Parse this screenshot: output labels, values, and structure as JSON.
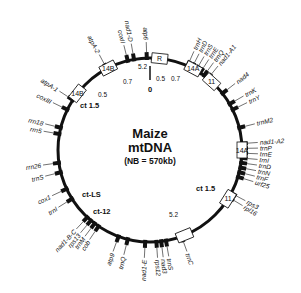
{
  "title": {
    "line1": "Maize",
    "line2": "mtDNA",
    "line3": "(NB = 570kb)"
  },
  "origin_label": "0",
  "colors": {
    "ink": "#111111",
    "background": "#ffffff"
  },
  "genes": [
    {
      "label": "atpA-2",
      "angle": -118,
      "side": "out"
    },
    {
      "label": "coxII",
      "angle": -104,
      "side": "out"
    },
    {
      "label": "nad1-D",
      "angle": -100,
      "side": "out"
    },
    {
      "label": "atp6",
      "angle": -92,
      "side": "out"
    },
    {
      "label": "trnH",
      "angle": -66,
      "side": "out"
    },
    {
      "label": "trnD",
      "angle": -63,
      "side": "out"
    },
    {
      "label": "trnS",
      "angle": -60,
      "side": "out"
    },
    {
      "label": "trnE",
      "angle": -57,
      "side": "out"
    },
    {
      "label": "trnQ",
      "angle": -54,
      "side": "out"
    },
    {
      "label": "nad1-A1",
      "angle": -51,
      "side": "out"
    },
    {
      "label": "nad4",
      "angle": -38,
      "side": "out"
    },
    {
      "label": "trnK",
      "angle": -30,
      "side": "out"
    },
    {
      "label": "trnY",
      "angle": -26,
      "side": "out"
    },
    {
      "label": "trnM2",
      "angle": -14,
      "side": "out"
    },
    {
      "label": "nad1-A2",
      "angle": -4,
      "side": "out"
    },
    {
      "label": "trnP",
      "angle": -1,
      "side": "out"
    },
    {
      "label": "trnE",
      "angle": 2,
      "side": "out"
    },
    {
      "label": "trnI",
      "angle": 5,
      "side": "out"
    },
    {
      "label": "trnD",
      "angle": 8,
      "side": "out"
    },
    {
      "label": "trnN",
      "angle": 11,
      "side": "out"
    },
    {
      "label": "trnF",
      "angle": 14,
      "side": "out"
    },
    {
      "label": "urf25",
      "angle": 17,
      "side": "out"
    },
    {
      "label": "rps3",
      "angle": 28,
      "side": "out"
    },
    {
      "label": "rpl16",
      "angle": 31,
      "side": "out"
    },
    {
      "label": "trnC",
      "angle": 70,
      "side": "out"
    },
    {
      "label": "trnS",
      "angle": 80,
      "side": "out"
    },
    {
      "label": "nad3",
      "angle": 83,
      "side": "out"
    },
    {
      "label": "rps12",
      "angle": 86,
      "side": "out"
    },
    {
      "label": "nad1-E",
      "angle": 93,
      "side": "out"
    },
    {
      "label": "trnQ",
      "angle": 104,
      "side": "out"
    },
    {
      "label": "atp9",
      "angle": 110,
      "side": "out"
    },
    {
      "label": "cob",
      "angle": 124,
      "side": "out"
    },
    {
      "label": "trnM",
      "angle": 127,
      "side": "out"
    },
    {
      "label": "rps13",
      "angle": 130,
      "side": "out"
    },
    {
      "label": "nad1-B-C",
      "angle": 133,
      "side": "out"
    },
    {
      "label": "trnI",
      "angle": 148,
      "side": "out"
    },
    {
      "label": "cox1",
      "angle": 155,
      "side": "out"
    },
    {
      "label": "trnS",
      "angle": 166,
      "side": "out"
    },
    {
      "label": "rrn26",
      "angle": 172,
      "side": "out"
    },
    {
      "label": "rrn5",
      "angle": 190,
      "side": "out"
    },
    {
      "label": "rrn18",
      "angle": 194,
      "side": "out"
    },
    {
      "label": "coxIII",
      "angle": 206,
      "side": "out"
    },
    {
      "label": "atpA-1",
      "angle": 213,
      "side": "out"
    }
  ],
  "repeats": [
    {
      "label": "14B",
      "angle": -117
    },
    {
      "label": "14B",
      "angle": -142
    },
    {
      "label": "R",
      "angle": -84
    },
    {
      "label": "14A",
      "angle": -62
    },
    {
      "label": "11",
      "angle": -48
    },
    {
      "label": "14A",
      "angle": 0
    },
    {
      "label": "11",
      "angle": 32
    },
    {
      "label": "",
      "angle": 68
    }
  ],
  "annotations": [
    {
      "text": "0.7",
      "x": 123,
      "y": 84
    },
    {
      "text": "5.2",
      "x": 138,
      "y": 69
    },
    {
      "text": "0.5",
      "x": 156,
      "y": 81
    },
    {
      "text": "0.7",
      "x": 171,
      "y": 81
    },
    {
      "text": "0.5",
      "x": 98,
      "y": 97
    },
    {
      "text": "5.2",
      "x": 169,
      "y": 217
    }
  ],
  "ct_labels": [
    {
      "text": "ct 1.5",
      "x": 80,
      "y": 108
    },
    {
      "text": "ct 1.5",
      "x": 196,
      "y": 191
    },
    {
      "text": "ct-LS",
      "x": 82,
      "y": 197
    },
    {
      "text": "ct-12",
      "x": 93,
      "y": 214
    }
  ]
}
